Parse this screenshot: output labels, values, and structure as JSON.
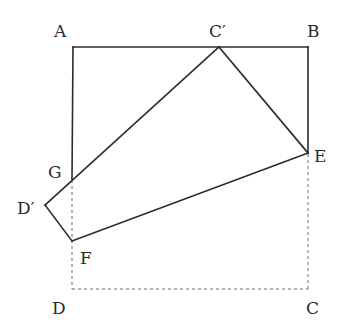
{
  "figure": {
    "labels": {
      "A": "A",
      "B": "B",
      "C": "C",
      "D": "D",
      "C_prime": "C′",
      "D_prime": "D′",
      "E": "E",
      "F": "F",
      "G": "G"
    },
    "points": {
      "A": [
        73,
        47
      ],
      "B": [
        308,
        47
      ],
      "C": [
        308,
        289
      ],
      "D": [
        72,
        289
      ],
      "C_prime": [
        219,
        47
      ],
      "D_prime": [
        45,
        205
      ],
      "E": [
        308,
        153
      ],
      "F": [
        72,
        241
      ],
      "G": [
        72,
        180
      ]
    },
    "segments_solid": [
      [
        "A",
        "B"
      ],
      [
        "A",
        "G"
      ],
      [
        "B",
        "E"
      ],
      [
        "C_prime",
        "E"
      ],
      [
        "C_prime",
        "D_prime"
      ],
      [
        "D_prime",
        "F"
      ],
      [
        "F",
        "E"
      ]
    ],
    "segments_dashed": [
      [
        "G",
        "D"
      ],
      [
        "D",
        "C"
      ],
      [
        "C",
        "E"
      ]
    ],
    "colors": {
      "line": "#2b2b2b",
      "dashed": "#6a6a6a",
      "background": "#ffffff"
    }
  }
}
